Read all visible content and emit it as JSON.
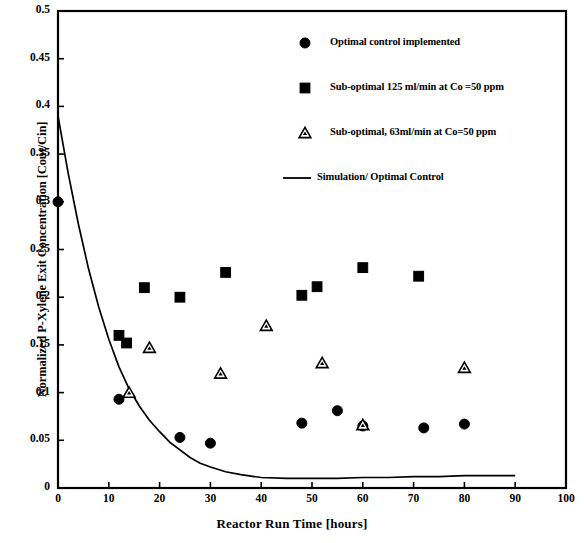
{
  "chart_data": {
    "type": "scatter",
    "title": "",
    "xlabel": "Reactor Run Time  [hours]",
    "ylabel": "Normalized P-Xylene Exit Concentration [Cout/Cin]",
    "xlim": [
      0,
      100
    ],
    "ylim": [
      0,
      0.5
    ],
    "xticks": [
      "0",
      "10",
      "20",
      "30",
      "40",
      "50",
      "60",
      "70",
      "80",
      "90",
      "100"
    ],
    "xtick_values": [
      0,
      10,
      20,
      30,
      40,
      50,
      60,
      70,
      80,
      90,
      100
    ],
    "yticks": [
      "0",
      "0.05",
      "0.1",
      "0.15",
      "0.2",
      "0.25",
      "0.3",
      "0.35",
      "0.4",
      "0.45",
      "0.5"
    ],
    "ytick_values": [
      0,
      0.05,
      0.1,
      0.15,
      0.2,
      0.25,
      0.3,
      0.35,
      0.4,
      0.45,
      0.5
    ],
    "grid": false,
    "legend_position": "upper-center-right",
    "series": [
      {
        "name": "Optimal control implemented",
        "marker": "filled-circle",
        "color": "#000000",
        "points": [
          {
            "x": 0,
            "y": 0.3
          },
          {
            "x": 12,
            "y": 0.093
          },
          {
            "x": 24,
            "y": 0.053
          },
          {
            "x": 30,
            "y": 0.047
          },
          {
            "x": 48,
            "y": 0.068
          },
          {
            "x": 55,
            "y": 0.081
          },
          {
            "x": 60,
            "y": 0.065
          },
          {
            "x": 72,
            "y": 0.063
          },
          {
            "x": 80,
            "y": 0.067
          }
        ]
      },
      {
        "name": "Sub-optimal 125 ml/min at Co =50 ppm",
        "marker": "filled-square",
        "color": "#000000",
        "points": [
          {
            "x": 12,
            "y": 0.16
          },
          {
            "x": 13.5,
            "y": 0.152
          },
          {
            "x": 17,
            "y": 0.21
          },
          {
            "x": 24,
            "y": 0.2
          },
          {
            "x": 33,
            "y": 0.226
          },
          {
            "x": 48,
            "y": 0.202
          },
          {
            "x": 51,
            "y": 0.211
          },
          {
            "x": 60,
            "y": 0.231
          },
          {
            "x": 71,
            "y": 0.222
          }
        ]
      },
      {
        "name": "Sub-optimal, 63ml/min at Co=50 ppm",
        "marker": "open-triangle",
        "color": "#000000",
        "points": [
          {
            "x": 14,
            "y": 0.1
          },
          {
            "x": 18,
            "y": 0.147
          },
          {
            "x": 32,
            "y": 0.12
          },
          {
            "x": 41,
            "y": 0.17
          },
          {
            "x": 52,
            "y": 0.131
          },
          {
            "x": 60,
            "y": 0.066
          },
          {
            "x": 80,
            "y": 0.126
          }
        ]
      },
      {
        "name": "Simulation/ Optimal Control",
        "marker": "line",
        "color": "#000000",
        "points": [
          {
            "x": 0,
            "y": 0.39
          },
          {
            "x": 2,
            "y": 0.33
          },
          {
            "x": 4,
            "y": 0.277
          },
          {
            "x": 6,
            "y": 0.23
          },
          {
            "x": 8,
            "y": 0.19
          },
          {
            "x": 10,
            "y": 0.156
          },
          {
            "x": 12,
            "y": 0.127
          },
          {
            "x": 14,
            "y": 0.104
          },
          {
            "x": 16,
            "y": 0.086
          },
          {
            "x": 18,
            "y": 0.071
          },
          {
            "x": 20,
            "y": 0.059
          },
          {
            "x": 22,
            "y": 0.048
          },
          {
            "x": 24,
            "y": 0.04
          },
          {
            "x": 26,
            "y": 0.032
          },
          {
            "x": 28,
            "y": 0.026
          },
          {
            "x": 30,
            "y": 0.022
          },
          {
            "x": 33,
            "y": 0.017
          },
          {
            "x": 36,
            "y": 0.014
          },
          {
            "x": 40,
            "y": 0.011
          },
          {
            "x": 45,
            "y": 0.01
          },
          {
            "x": 50,
            "y": 0.01
          },
          {
            "x": 55,
            "y": 0.01
          },
          {
            "x": 60,
            "y": 0.011
          },
          {
            "x": 65,
            "y": 0.011
          },
          {
            "x": 70,
            "y": 0.012
          },
          {
            "x": 75,
            "y": 0.012
          },
          {
            "x": 80,
            "y": 0.013
          },
          {
            "x": 85,
            "y": 0.013
          },
          {
            "x": 90,
            "y": 0.013
          }
        ]
      }
    ],
    "legend_entries": [
      {
        "label": "Optimal control implemented",
        "marker": "filled-circle"
      },
      {
        "label": "Sub-optimal 125 ml/min at Co =50 ppm",
        "marker": "filled-square"
      },
      {
        "label": "Sub-optimal, 63ml/min at Co=50 ppm",
        "marker": "open-triangle"
      },
      {
        "label": "Simulation/ Optimal Control",
        "marker": "line"
      }
    ]
  }
}
